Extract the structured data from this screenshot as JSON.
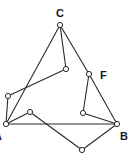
{
  "diagram": {
    "type": "graph",
    "colors": {
      "stroke": "#2a2a2a",
      "node_fill": "#ffffff",
      "label": "#1a1a1a",
      "background": "#ffffff"
    },
    "nodes": [
      {
        "id": "C",
        "x": 60,
        "y": 25,
        "label": "C",
        "lx": 56,
        "ly": 17
      },
      {
        "id": "n1",
        "x": 66,
        "y": 69,
        "label": ""
      },
      {
        "id": "F",
        "x": 89,
        "y": 74,
        "label": "F",
        "lx": 100,
        "ly": 79
      },
      {
        "id": "n2",
        "x": 8,
        "y": 96,
        "label": ""
      },
      {
        "id": "A",
        "x": 6,
        "y": 124,
        "label": "A",
        "lx": -6,
        "ly": 140
      },
      {
        "id": "n3",
        "x": 30,
        "y": 112,
        "label": ""
      },
      {
        "id": "n4",
        "x": 83,
        "y": 113,
        "label": ""
      },
      {
        "id": "B",
        "x": 117,
        "y": 124,
        "label": "B",
        "lx": 120,
        "ly": 140
      },
      {
        "id": "n5",
        "x": 82,
        "y": 150,
        "label": ""
      }
    ],
    "edges": [
      [
        "C",
        "A"
      ],
      [
        "C",
        "F"
      ],
      [
        "F",
        "B"
      ],
      [
        "C",
        "n1"
      ],
      [
        "n1",
        "n2"
      ],
      [
        "n2",
        "A"
      ],
      [
        "A",
        "n3"
      ],
      [
        "n3",
        "n5"
      ],
      [
        "n5",
        "B"
      ],
      [
        "A",
        "B"
      ],
      [
        "F",
        "n4"
      ],
      [
        "n4",
        "B"
      ]
    ]
  }
}
